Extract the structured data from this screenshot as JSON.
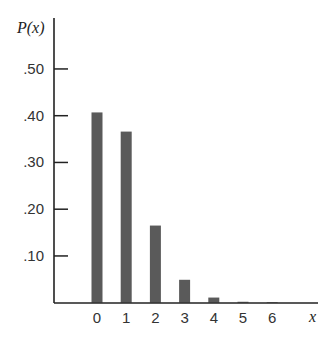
{
  "chart_data": {
    "type": "bar",
    "title": "",
    "xlabel": "x",
    "ylabel": "P(x)",
    "categories": [
      "0",
      "1",
      "2",
      "3",
      "4",
      "5",
      "6"
    ],
    "values": [
      0.407,
      0.366,
      0.165,
      0.049,
      0.011,
      0.002,
      0.0003
    ],
    "ylim": [
      0,
      0.55
    ],
    "yticks": [
      ".10",
      ".20",
      ".30",
      ".40",
      ".50"
    ],
    "ytick_values": [
      0.1,
      0.2,
      0.3,
      0.4,
      0.5
    ],
    "grid": false,
    "legend": null,
    "bar_color": "#5a5a5a",
    "axis_color": "#222222"
  }
}
